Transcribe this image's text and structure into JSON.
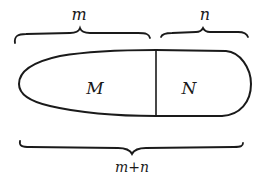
{
  "diagram": {
    "type": "set-partition",
    "labels": {
      "top_left_brace": "m",
      "top_right_brace": "n",
      "bottom_brace": "m+n",
      "left_region": "M",
      "right_region": "N"
    },
    "colors": {
      "stroke": "#1a1a1a",
      "background": "#ffffff"
    }
  }
}
